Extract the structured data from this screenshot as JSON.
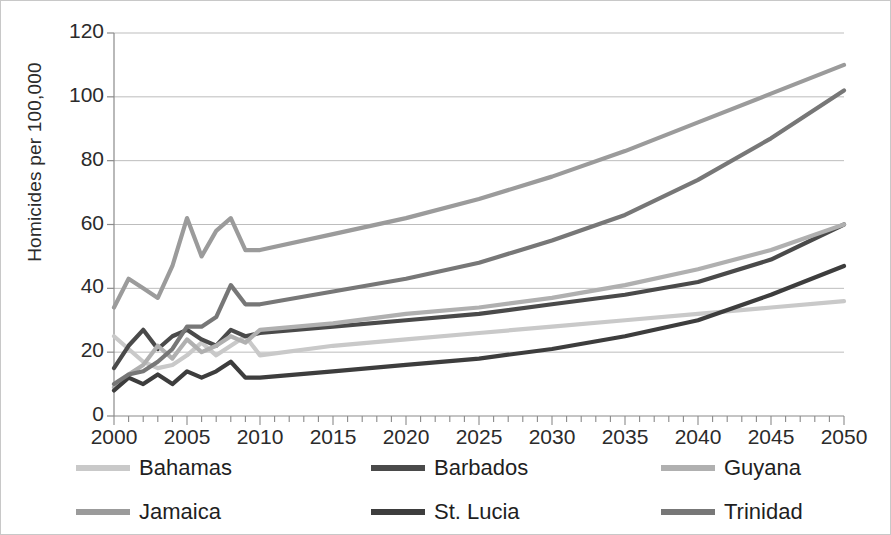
{
  "chart_data": {
    "type": "line",
    "title": "",
    "xlabel": "",
    "ylabel": "Homicides per 100,000",
    "xlim": [
      2000,
      2050
    ],
    "ylim": [
      0,
      120
    ],
    "ytick_labels": [
      "0",
      "20",
      "40",
      "60",
      "80",
      "100",
      "120"
    ],
    "ytick_values": [
      0,
      20,
      40,
      60,
      80,
      100,
      120
    ],
    "xtick_labels": [
      "2000",
      "2005",
      "2010",
      "2015",
      "2020",
      "2025",
      "2030",
      "2035",
      "2040",
      "2045",
      "2050"
    ],
    "xtick_values": [
      2000,
      2005,
      2010,
      2015,
      2020,
      2025,
      2030,
      2035,
      2040,
      2045,
      2050
    ],
    "minor_xticks_every": 1,
    "grid": "horizontal",
    "legend_position": "bottom",
    "x": [
      2000,
      2001,
      2002,
      2003,
      2004,
      2005,
      2006,
      2007,
      2008,
      2009,
      2010,
      2015,
      2020,
      2025,
      2030,
      2035,
      2040,
      2045,
      2050
    ],
    "series": [
      {
        "name": "Bahamas",
        "color": "#c9c9c9",
        "values": [
          25,
          21,
          17,
          15,
          16,
          19,
          23,
          19,
          22,
          25,
          19,
          22,
          24,
          26,
          28,
          30,
          32,
          34,
          36
        ]
      },
      {
        "name": "Barbados",
        "color": "#4a4a4a",
        "values": [
          15,
          22,
          27,
          21,
          25,
          27,
          24,
          22,
          27,
          25,
          26,
          28,
          30,
          32,
          35,
          38,
          42,
          49,
          60
        ]
      },
      {
        "name": "Guyana",
        "color": "#b0b0b0",
        "values": [
          9,
          13,
          16,
          22,
          18,
          24,
          20,
          22,
          25,
          23,
          27,
          29,
          32,
          34,
          37,
          41,
          46,
          52,
          60
        ]
      },
      {
        "name": "Jamaica",
        "color": "#9b9b9b",
        "values": [
          34,
          43,
          40,
          37,
          47,
          62,
          50,
          58,
          62,
          52,
          52,
          57,
          62,
          68,
          75,
          83,
          92,
          101,
          110
        ]
      },
      {
        "name": "St. Lucia",
        "color": "#3d3d3d",
        "values": [
          8,
          12,
          10,
          13,
          10,
          14,
          12,
          14,
          17,
          12,
          12,
          14,
          16,
          18,
          21,
          25,
          30,
          38,
          47
        ]
      },
      {
        "name": "Trinidad",
        "color": "#777777",
        "values": [
          10,
          13,
          14,
          17,
          21,
          28,
          28,
          31,
          41,
          35,
          35,
          39,
          43,
          48,
          55,
          63,
          74,
          87,
          102
        ]
      }
    ]
  },
  "legend": {
    "entries": [
      {
        "label": "Bahamas"
      },
      {
        "label": "Barbados"
      },
      {
        "label": "Guyana"
      },
      {
        "label": "Jamaica"
      },
      {
        "label": "St. Lucia"
      },
      {
        "label": "Trinidad"
      }
    ]
  }
}
